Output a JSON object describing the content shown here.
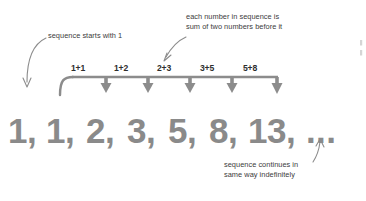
{
  "diagram": {
    "colors": {
      "sequence_gray": "#8a8a8a",
      "bracket_gray": "#8c8c8c",
      "label_dark": "#2e2e2e",
      "annotation_gray": "#3b3b3b",
      "arrow_gray": "#8c8c8c",
      "background": "#ffffff"
    },
    "sequence": {
      "terms": [
        {
          "value": "1,",
          "x": 8
        },
        {
          "value": "1,",
          "x": 46
        },
        {
          "value": "2,",
          "x": 86
        },
        {
          "value": "3,",
          "x": 127
        },
        {
          "value": "5,",
          "x": 168
        },
        {
          "value": "8,",
          "x": 209
        },
        {
          "value": "13,",
          "x": 248
        }
      ],
      "ellipsis": {
        "value": "...",
        "x": 306
      }
    },
    "operations": [
      {
        "label": "1+1",
        "x": 71,
        "y": 63
      },
      {
        "label": "1+2",
        "x": 114,
        "y": 63
      },
      {
        "label": "2+3",
        "x": 157,
        "y": 63
      },
      {
        "label": "3+5",
        "x": 200,
        "y": 63
      },
      {
        "label": "5+8",
        "x": 243,
        "y": 63
      }
    ],
    "annotations": [
      {
        "id": "start",
        "lines": [
          "sequence starts with 1"
        ],
        "target": "first term"
      },
      {
        "id": "rule",
        "lines": [
          "each number in sequence is",
          "sum of two numbers before it"
        ],
        "target": "2+3 bracket label"
      },
      {
        "id": "continues",
        "lines": [
          "sequence continues in",
          "same way indefinitely"
        ],
        "target": "ellipsis"
      }
    ],
    "edge_fragment": {
      "lines": [
        "e",
        "e"
      ],
      "note": "cut-off text at right edge"
    }
  }
}
